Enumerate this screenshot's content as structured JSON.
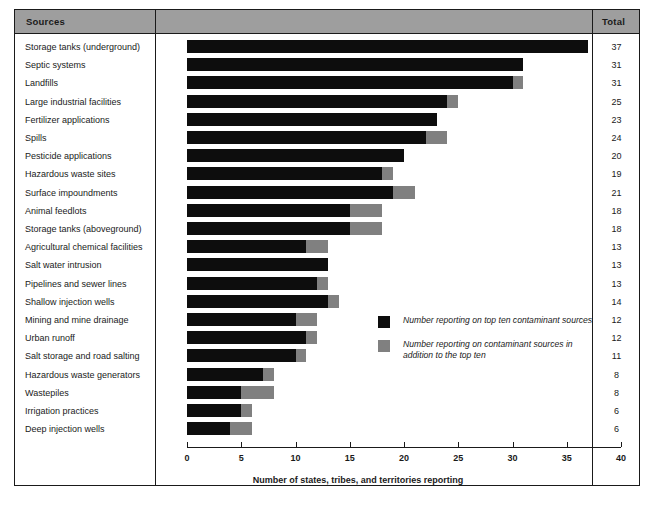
{
  "table": {
    "header": {
      "sources_label": "Sources",
      "total_label": "Total"
    }
  },
  "legend": {
    "items": [
      {
        "swatch": "black",
        "color": "#0d0d0d",
        "text": "Number reporting on top ten contaminant sources"
      },
      {
        "swatch": "gray",
        "color": "#808080",
        "text": "Number reporting on contaminant sources in addition to the top ten"
      }
    ]
  },
  "axis": {
    "title": "Number of states, tribes, and territories reporting",
    "ticks": [
      "0",
      "5",
      "10",
      "15",
      "20",
      "25",
      "30",
      "35",
      "40"
    ],
    "min": 0,
    "max": 40
  },
  "caption": "",
  "chart_data": {
    "type": "bar",
    "orientation": "horizontal",
    "stacked": true,
    "title": "",
    "xlabel": "Number of states, tribes, and territories reporting",
    "ylabel": "Sources",
    "xlim": [
      0,
      40
    ],
    "xticks": [
      0,
      5,
      10,
      15,
      20,
      25,
      30,
      35,
      40
    ],
    "grid": false,
    "legend_position": "inside-center-right",
    "categories": [
      "Storage tanks (underground)",
      "Septic systems",
      "Landfills",
      "Large industrial facilities",
      "Fertilizer applications",
      "Spills",
      "Pesticide applications",
      "Hazardous waste sites",
      "Surface impoundments",
      "Animal feedlots",
      "Storage tanks (aboveground)",
      "Agricultural chemical facilities",
      "Salt water intrusion",
      "Pipelines and sewer lines",
      "Shallow injection wells",
      "Mining and mine drainage",
      "Urban runoff",
      "Salt storage and road salting",
      "Hazardous waste generators",
      "Wastepiles",
      "Irrigation practices",
      "Deep injection wells"
    ],
    "series": [
      {
        "name": "Number reporting on top ten contaminant sources",
        "color": "#0d0d0d",
        "values": [
          37,
          31,
          30,
          24,
          23,
          22,
          20,
          18,
          19,
          15,
          15,
          11,
          13,
          12,
          13,
          10,
          11,
          10,
          7,
          5,
          5,
          4
        ]
      },
      {
        "name": "Number reporting on contaminant sources in addition to the top ten",
        "color": "#808080",
        "values": [
          0,
          0,
          1,
          1,
          0,
          2,
          0,
          1,
          2,
          3,
          3,
          2,
          0,
          1,
          1,
          2,
          1,
          1,
          1,
          3,
          1,
          2
        ]
      }
    ],
    "totals": [
      37,
      31,
      31,
      25,
      23,
      24,
      20,
      19,
      21,
      18,
      18,
      13,
      13,
      13,
      14,
      12,
      12,
      11,
      8,
      8,
      6,
      6
    ]
  }
}
